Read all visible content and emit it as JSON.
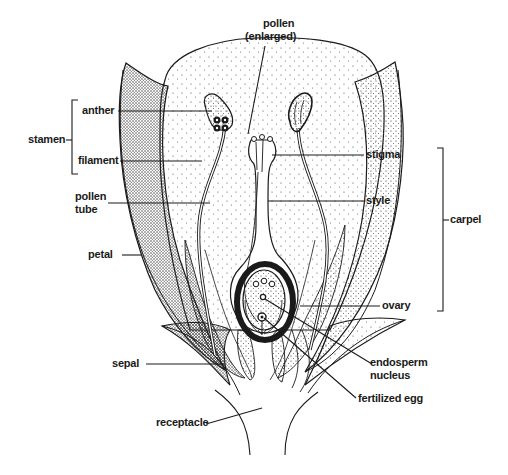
{
  "diagram": {
    "colors": {
      "ink": "#1a1a1a",
      "background": "#ffffff"
    },
    "labels": {
      "pollen": "pollen",
      "pollen_sub": "(enlarged)",
      "anther": "anther",
      "stamen": "stamen",
      "filament": "filament",
      "pollen_tube_1": "pollen",
      "pollen_tube_2": "tube",
      "petal": "petal",
      "sepal": "sepal",
      "receptacle": "receptacle",
      "stigma": "stigma",
      "style": "style",
      "carpel": "carpel",
      "ovary": "ovary",
      "endosperm_1": "endosperm",
      "endosperm_2": "nucleus",
      "fertilized_egg": "fertilized egg"
    },
    "groups": {
      "stamen": [
        "anther",
        "filament"
      ],
      "carpel": [
        "stigma",
        "style",
        "ovary"
      ]
    }
  }
}
